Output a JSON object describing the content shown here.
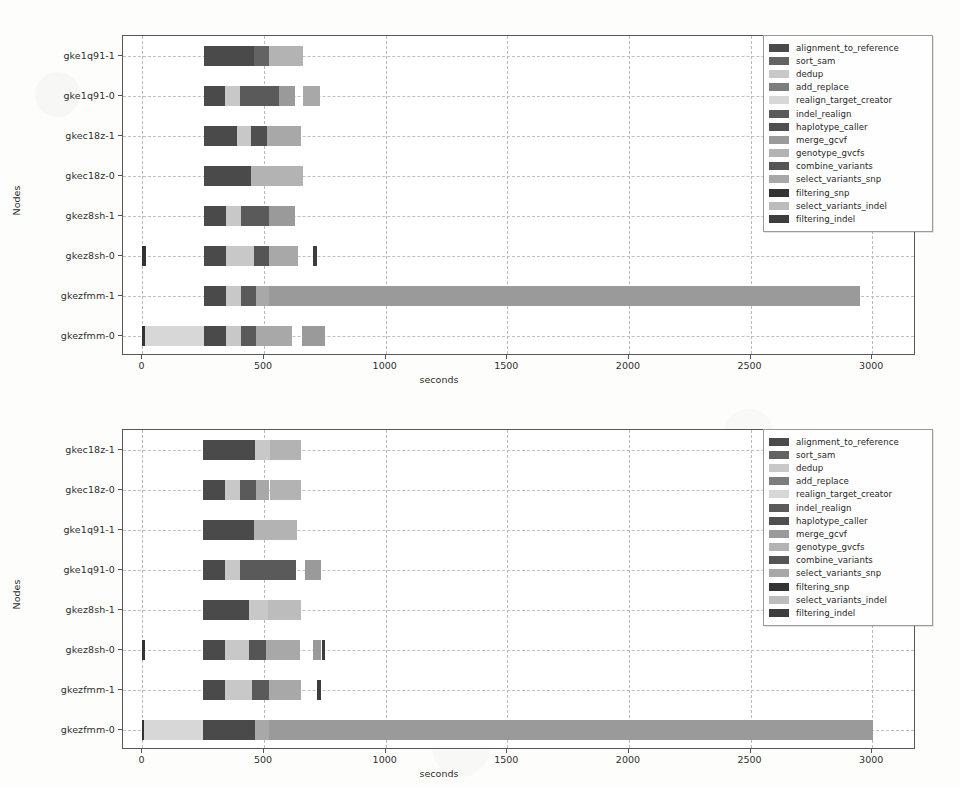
{
  "figure": {
    "axis": {
      "xlabel": "seconds",
      "ylabel": "Nodes",
      "xticks": [
        0,
        500,
        1000,
        1500,
        2000,
        2500,
        3000
      ],
      "xlim": [
        -80,
        3180
      ],
      "grid": true
    },
    "stages": [
      {
        "name": "alignment_to_reference",
        "color": "#4a4a4a"
      },
      {
        "name": "sort_sam",
        "color": "#636363"
      },
      {
        "name": "dedup",
        "color": "#c8c8c8"
      },
      {
        "name": "add_replace",
        "color": "#7d7d7d"
      },
      {
        "name": "realign_target_creator",
        "color": "#d7d7d7"
      },
      {
        "name": "indel_realign",
        "color": "#5a5a5a"
      },
      {
        "name": "haplotype_caller",
        "color": "#4f4f4f"
      },
      {
        "name": "merge_gcvf",
        "color": "#9a9a9a"
      },
      {
        "name": "genotype_gvcfs",
        "color": "#b3b3b3"
      },
      {
        "name": "combine_variants",
        "color": "#555555"
      },
      {
        "name": "select_variants_snp",
        "color": "#a8a8a8"
      },
      {
        "name": "filtering_snp",
        "color": "#333333"
      },
      {
        "name": "select_variants_indel",
        "color": "#bcbcbc"
      },
      {
        "name": "filtering_indel",
        "color": "#3d3d3d"
      }
    ]
  },
  "chart_data": [
    {
      "type": "bar",
      "orientation": "horizontal",
      "stacked_timeline": true,
      "title": "",
      "xlabel": "seconds",
      "ylabel": "Nodes",
      "xlim": [
        -80,
        3180
      ],
      "xticks": [
        0,
        500,
        1000,
        1500,
        2000,
        2500,
        3000
      ],
      "grid": true,
      "legend_position": "upper right",
      "categories": [
        "gke1q91-1",
        "gke1q91-0",
        "gkec18z-1",
        "gkec18z-0",
        "gkez8sh-1",
        "gkez8sh-0",
        "gkezfmm-1",
        "gkezfmm-0"
      ],
      "rows": [
        {
          "node": "gke1q91-1",
          "bars": [
            {
              "stage": "alignment_to_reference",
              "start": 252,
              "end": 460
            },
            {
              "stage": "sort_sam",
              "start": 460,
              "end": 520
            },
            {
              "stage": "genotype_gvcfs",
              "start": 520,
              "end": 658
            }
          ]
        },
        {
          "node": "gke1q91-0",
          "bars": [
            {
              "stage": "alignment_to_reference",
              "start": 252,
              "end": 340
            },
            {
              "stage": "dedup",
              "start": 340,
              "end": 400
            },
            {
              "stage": "indel_realign",
              "start": 400,
              "end": 560
            },
            {
              "stage": "merge_gcvf",
              "start": 560,
              "end": 628
            },
            {
              "stage": "select_variants_snp",
              "start": 660,
              "end": 728
            }
          ]
        },
        {
          "node": "gkec18z-1",
          "bars": [
            {
              "stage": "alignment_to_reference",
              "start": 252,
              "end": 390
            },
            {
              "stage": "dedup",
              "start": 390,
              "end": 448
            },
            {
              "stage": "haplotype_caller",
              "start": 448,
              "end": 512
            },
            {
              "stage": "select_variants_snp",
              "start": 512,
              "end": 652
            }
          ]
        },
        {
          "node": "gkec18z-0",
          "bars": [
            {
              "stage": "alignment_to_reference",
              "start": 252,
              "end": 448
            },
            {
              "stage": "genotype_gvcfs",
              "start": 448,
              "end": 660
            }
          ]
        },
        {
          "node": "gkez8sh-1",
          "bars": [
            {
              "stage": "alignment_to_reference",
              "start": 252,
              "end": 344
            },
            {
              "stage": "dedup",
              "start": 344,
              "end": 404
            },
            {
              "stage": "indel_realign",
              "start": 404,
              "end": 520
            },
            {
              "stage": "merge_gcvf",
              "start": 520,
              "end": 628
            }
          ]
        },
        {
          "node": "gkez8sh-0",
          "bars": [
            {
              "stage": "filtering_snp",
              "start": 0,
              "end": 14
            },
            {
              "stage": "alignment_to_reference",
              "start": 252,
              "end": 344
            },
            {
              "stage": "dedup",
              "start": 344,
              "end": 458
            },
            {
              "stage": "combine_variants",
              "start": 458,
              "end": 520
            },
            {
              "stage": "select_variants_snp",
              "start": 520,
              "end": 640
            },
            {
              "stage": "filtering_indel",
              "start": 700,
              "end": 716
            }
          ]
        },
        {
          "node": "gkezfmm-1",
          "bars": [
            {
              "stage": "alignment_to_reference",
              "start": 252,
              "end": 344
            },
            {
              "stage": "dedup",
              "start": 344,
              "end": 404
            },
            {
              "stage": "indel_realign",
              "start": 404,
              "end": 468
            },
            {
              "stage": "select_variants_snp",
              "start": 468,
              "end": 520
            },
            {
              "stage": "merge_gcvf",
              "start": 520,
              "end": 2950
            }
          ]
        },
        {
          "node": "gkezfmm-0",
          "bars": [
            {
              "stage": "filtering_snp",
              "start": 0,
              "end": 10
            },
            {
              "stage": "realign_target_creator",
              "start": 10,
              "end": 252
            },
            {
              "stage": "alignment_to_reference",
              "start": 252,
              "end": 344
            },
            {
              "stage": "dedup",
              "start": 344,
              "end": 404
            },
            {
              "stage": "indel_realign",
              "start": 404,
              "end": 468
            },
            {
              "stage": "select_variants_snp",
              "start": 468,
              "end": 614
            },
            {
              "stage": "merge_gcvf",
              "start": 656,
              "end": 752
            }
          ]
        }
      ]
    },
    {
      "type": "bar",
      "orientation": "horizontal",
      "stacked_timeline": true,
      "title": "",
      "xlabel": "seconds",
      "ylabel": "Nodes",
      "xlim": [
        -80,
        3180
      ],
      "xticks": [
        0,
        500,
        1000,
        1500,
        2000,
        2500,
        3000
      ],
      "grid": true,
      "legend_position": "upper right",
      "categories": [
        "gkec18z-1",
        "gkec18z-0",
        "gke1q91-1",
        "gke1q91-0",
        "gkez8sh-1",
        "gkez8sh-0",
        "gkezfmm-1",
        "gkezfmm-0"
      ],
      "rows": [
        {
          "node": "gkec18z-1",
          "bars": [
            {
              "stage": "alignment_to_reference",
              "start": 250,
              "end": 464
            },
            {
              "stage": "dedup",
              "start": 464,
              "end": 524
            },
            {
              "stage": "genotype_gvcfs",
              "start": 524,
              "end": 652
            }
          ]
        },
        {
          "node": "gkec18z-0",
          "bars": [
            {
              "stage": "alignment_to_reference",
              "start": 250,
              "end": 340
            },
            {
              "stage": "dedup",
              "start": 340,
              "end": 400
            },
            {
              "stage": "indel_realign",
              "start": 400,
              "end": 468
            },
            {
              "stage": "select_variants_snp",
              "start": 468,
              "end": 520
            },
            {
              "stage": "genotype_gvcfs",
              "start": 524,
              "end": 652
            }
          ]
        },
        {
          "node": "gke1q91-1",
          "bars": [
            {
              "stage": "alignment_to_reference",
              "start": 250,
              "end": 460
            },
            {
              "stage": "genotype_gvcfs",
              "start": 460,
              "end": 636
            }
          ]
        },
        {
          "node": "gke1q91-0",
          "bars": [
            {
              "stage": "alignment_to_reference",
              "start": 250,
              "end": 340
            },
            {
              "stage": "dedup",
              "start": 340,
              "end": 400
            },
            {
              "stage": "indel_realign",
              "start": 400,
              "end": 630
            },
            {
              "stage": "merge_gcvf",
              "start": 668,
              "end": 736
            }
          ]
        },
        {
          "node": "gkez8sh-1",
          "bars": [
            {
              "stage": "alignment_to_reference",
              "start": 250,
              "end": 436
            },
            {
              "stage": "dedup",
              "start": 436,
              "end": 516
            },
            {
              "stage": "select_variants_indel",
              "start": 516,
              "end": 652
            }
          ]
        },
        {
          "node": "gkez8sh-0",
          "bars": [
            {
              "stage": "filtering_snp",
              "start": 0,
              "end": 12
            },
            {
              "stage": "alignment_to_reference",
              "start": 250,
              "end": 340
            },
            {
              "stage": "dedup",
              "start": 340,
              "end": 440
            },
            {
              "stage": "combine_variants",
              "start": 440,
              "end": 508
            },
            {
              "stage": "select_variants_snp",
              "start": 508,
              "end": 648
            },
            {
              "stage": "merge_gcvf",
              "start": 700,
              "end": 736
            },
            {
              "stage": "filtering_indel",
              "start": 740,
              "end": 752
            }
          ]
        },
        {
          "node": "gkezfmm-1",
          "bars": [
            {
              "stage": "alignment_to_reference",
              "start": 250,
              "end": 340
            },
            {
              "stage": "dedup",
              "start": 340,
              "end": 450
            },
            {
              "stage": "indel_realign",
              "start": 450,
              "end": 520
            },
            {
              "stage": "select_variants_snp",
              "start": 520,
              "end": 652
            },
            {
              "stage": "filtering_indel",
              "start": 718,
              "end": 732
            }
          ]
        },
        {
          "node": "gkezfmm-0",
          "bars": [
            {
              "stage": "filtering_snp",
              "start": 0,
              "end": 8
            },
            {
              "stage": "realign_target_creator",
              "start": 8,
              "end": 250
            },
            {
              "stage": "alignment_to_reference",
              "start": 250,
              "end": 464
            },
            {
              "stage": "select_variants_snp",
              "start": 464,
              "end": 520
            },
            {
              "stage": "merge_gcvf",
              "start": 520,
              "end": 3005
            }
          ]
        }
      ]
    }
  ]
}
